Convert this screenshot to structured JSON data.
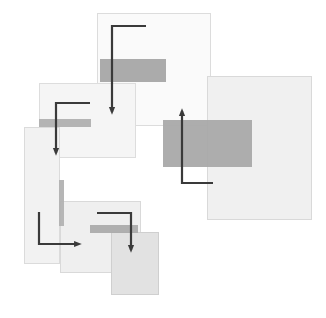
{
  "canvas": {
    "width": 326,
    "height": 318,
    "background": "#ffffff",
    "title": "Abstract composition of overlapping translucent rectangles with right-angle arrow connectors"
  },
  "palette": {
    "background": "#ffffff",
    "panel_lightest": "#fbfbfb",
    "panel_light": "#f4f4f4",
    "panel_mid": "#eeeeee",
    "panel_mid_dark": "#e7e7e7",
    "panel_dark": "#e0e0e0",
    "band_gray": "#a8a8a8",
    "band_gray_light": "#b4b4b4",
    "stroke_outline": "#d8d8d8",
    "connector_dark": "#3a3a3a"
  },
  "shapes": {
    "rectangles": [
      {
        "id": "rect-top-center",
        "label": "Top center panel",
        "x": 97,
        "y": 13,
        "width": 113,
        "height": 112,
        "fill": "#fafafa",
        "stroke": "#dcdcdc",
        "opacity": 1
      },
      {
        "id": "rect-right-large",
        "label": "Large right panel",
        "x": 207,
        "y": 76,
        "width": 104,
        "height": 143,
        "fill": "#f0f0f0",
        "stroke": "#d9d9d9",
        "opacity": 1
      },
      {
        "id": "rect-mid-left",
        "label": "Middle left panel",
        "x": 39,
        "y": 83,
        "width": 96,
        "height": 74,
        "fill": "#f5f5f5",
        "stroke": "#dddddd",
        "opacity": 1
      },
      {
        "id": "rect-lower-left",
        "label": "Lower left tall panel",
        "x": 24,
        "y": 127,
        "width": 35,
        "height": 136,
        "fill": "#f2f2f2",
        "stroke": "#dbdbdb",
        "opacity": 1
      },
      {
        "id": "rect-bottom-mid",
        "label": "Bottom middle panel",
        "x": 60,
        "y": 201,
        "width": 80,
        "height": 71,
        "fill": "#efefef",
        "stroke": "#d9d9d9",
        "opacity": 1
      },
      {
        "id": "rect-bottom-dark",
        "label": "Bottom darkest panel",
        "x": 111,
        "y": 232,
        "width": 47,
        "height": 62,
        "fill": "#e2e2e2",
        "stroke": "#cfcfcf",
        "opacity": 1
      }
    ],
    "bands": [
      {
        "id": "band-top",
        "label": "Top dark band",
        "x": 100,
        "y": 59,
        "width": 66,
        "height": 23,
        "fill": "#a6a6a6",
        "opacity": 0.95
      },
      {
        "id": "band-right-large",
        "label": "Right large dark band",
        "x": 163,
        "y": 120,
        "width": 89,
        "height": 47,
        "fill": "#a9a9a9",
        "opacity": 0.95
      },
      {
        "id": "band-mid-left",
        "label": "Middle left thin band",
        "x": 39,
        "y": 119,
        "width": 52,
        "height": 8,
        "fill": "#b0b0b0",
        "opacity": 0.95
      },
      {
        "id": "band-bottom",
        "label": "Bottom thin band",
        "x": 90,
        "y": 225,
        "width": 48,
        "height": 8,
        "fill": "#ababab",
        "opacity": 0.95
      },
      {
        "id": "band-vertical-left",
        "label": "Left vertical bar",
        "x": 59,
        "y": 180,
        "width": 5,
        "height": 46,
        "fill": "#b2b2b2",
        "opacity": 0.95
      }
    ],
    "connectors": [
      {
        "id": "connector-top",
        "label": "Top elbow connector pointing down",
        "path": "M 146 26 L 112 26 L 112 112",
        "arrow_at": {
          "x": 112,
          "y": 112
        },
        "arrow_direction": "down",
        "stroke": "#3a3a3a",
        "stroke_width": 2.2
      },
      {
        "id": "connector-mid-left",
        "label": "Middle left elbow connector pointing down",
        "path": "M 90 103 L 56 103 L 56 153",
        "arrow_at": {
          "x": 56,
          "y": 153
        },
        "arrow_direction": "down",
        "stroke": "#3a3a3a",
        "stroke_width": 2.2
      },
      {
        "id": "connector-right",
        "label": "Right elbow connector pointing up",
        "path": "M 213 183 L 182 183 L 182 111",
        "arrow_at": {
          "x": 182,
          "y": 111
        },
        "arrow_direction": "up",
        "stroke": "#3a3a3a",
        "stroke_width": 2.2
      },
      {
        "id": "connector-lower-left",
        "label": "Lower left elbow connector pointing right",
        "path": "M 39 212 L 39 244 L 79 244",
        "arrow_at": {
          "x": 79,
          "y": 244
        },
        "arrow_direction": "right",
        "stroke": "#3a3a3a",
        "stroke_width": 2.2
      },
      {
        "id": "connector-bottom",
        "label": "Bottom elbow connector pointing down",
        "path": "M 97 213 L 131 213 L 131 250",
        "arrow_at": {
          "x": 131,
          "y": 250
        },
        "arrow_direction": "down",
        "stroke": "#3a3a3a",
        "stroke_width": 2.2
      }
    ]
  }
}
